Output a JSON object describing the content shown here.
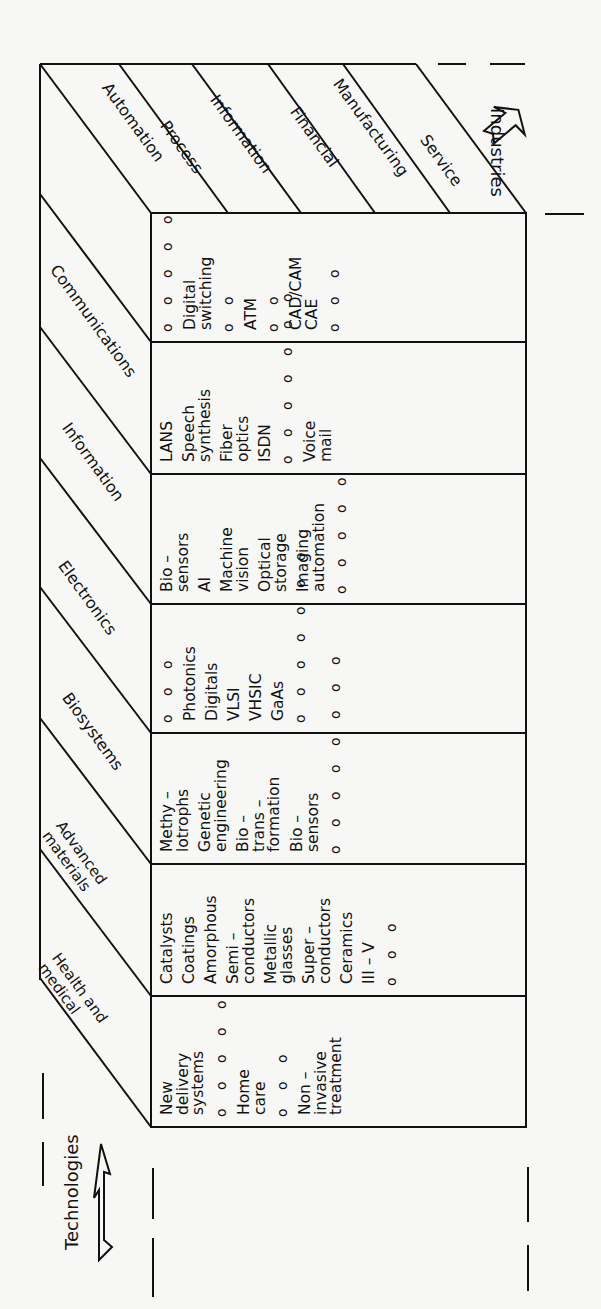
{
  "diagram": {
    "orientation": "rotated 90 degrees counterclockwise",
    "axis_labels": {
      "industries": "Industries",
      "technologies": "Technologies"
    },
    "industries": [
      "Automation",
      "Process",
      "Information",
      "Financial",
      "Manufacturing",
      "Service"
    ],
    "technologies": [
      "Communications",
      "Information",
      "Electronics",
      "Biosystems",
      "Advanced materials",
      "Health and medical"
    ],
    "technology_labels_multiline": {
      "advanced_materials": [
        "Advanced",
        "materials"
      ],
      "health_and_medical": [
        "Health and",
        "medical"
      ]
    },
    "rows": [
      {
        "technology": "Communications",
        "items": [
          "Digital switching",
          "ATM",
          "CAD/CAM CAE"
        ],
        "text_lines": [
          {
            "t": "o o o o o",
            "kind": "dots"
          },
          {
            "t": "Digital\nswitching"
          },
          {
            "t": "o o",
            "kind": "dots"
          },
          {
            "t": "ATM"
          },
          {
            "t": "o o",
            "kind": "dots"
          },
          {
            "t": "CAD/CAM\nCAE"
          },
          {
            "t": "o o o",
            "kind": "dots"
          }
        ]
      },
      {
        "technology": "Information",
        "items": [
          "LANS",
          "Speech synthesis",
          "Fiber optics",
          "ISDN",
          "Voice mail"
        ],
        "text_lines": [
          {
            "t": "LANS"
          },
          {
            "t": "Speech\nsynthesis"
          },
          {
            "t": "Fiber\noptics"
          },
          {
            "t": "ISDN"
          },
          {
            "t": "o o o o o o o",
            "kind": "dots"
          },
          {
            "t": "Voice\nmail"
          }
        ]
      },
      {
        "technology": "Electronics",
        "items": [
          "Bio-sensors",
          "AI",
          "Machine vision",
          "Optical storage",
          "Imaging automation"
        ],
        "text_lines": [
          {
            "t": "Bio –\nsensors"
          },
          {
            "t": "AI"
          },
          {
            "t": "Machine\nvision"
          },
          {
            "t": "Optical\nstorage"
          },
          {
            "t": "Imaging\nautomation"
          },
          {
            "t": "o o o o o",
            "kind": "dots"
          }
        ]
      },
      {
        "technology": "Biosystems",
        "items": [
          "Photonics",
          "Digitals",
          "VLSI",
          "VHSIC",
          "GaAs"
        ],
        "text_lines": [
          {
            "t": "o o o",
            "kind": "dots"
          },
          {
            "t": "Photonics"
          },
          {
            "t": "Digitals"
          },
          {
            "t": "VLSI"
          },
          {
            "t": "VHSIC"
          },
          {
            "t": "GaAs"
          },
          {
            "t": "o o o o o o o",
            "kind": "dots"
          }
        ]
      },
      {
        "technology": "Advanced materials",
        "items": [
          "Methylotrophs",
          "Genetic engineering",
          "Bio-transformation",
          "Bio-sensors"
        ],
        "text_lines": [
          {
            "t": "Methy –\nlotrophs"
          },
          {
            "t": "Genetic\nengineering"
          },
          {
            "t": "Bio –\ntrans –\nformation"
          },
          {
            "t": "Bio –\nsensors"
          },
          {
            "t": "o o o o o o o o",
            "kind": "dots"
          }
        ]
      },
      {
        "technology": "Health and medical",
        "items": [
          "Catalysts",
          "Coatings",
          "Amorphous",
          "Semi-conductors",
          "Metallic glasses",
          "Super-conductors",
          "Ceramics",
          "III-V"
        ],
        "text_lines": [
          {
            "t": "Catalysts"
          },
          {
            "t": "Coatings"
          },
          {
            "t": "Amorphous"
          },
          {
            "t": "Semi –\nconductors"
          },
          {
            "t": "Metallic\nglasses"
          },
          {
            "t": "Super –\nconductors"
          },
          {
            "t": "Ceramics"
          },
          {
            "t": "III – V"
          },
          {
            "t": "o o o",
            "kind": "dots"
          }
        ]
      },
      {
        "technology": "(bottom)",
        "items": [
          "New delivery systems",
          "Home care",
          "Non-invasive treatment"
        ],
        "text_lines": [
          {
            "t": "New\ndelivery\nsystems"
          },
          {
            "t": "o o o o o",
            "kind": "dots"
          },
          {
            "t": "Home\ncare"
          },
          {
            "t": "o o o",
            "kind": "dots"
          },
          {
            "t": "Non –\ninvasive\ntreatment"
          }
        ]
      }
    ],
    "colors": {
      "line": "#111111",
      "background": "#f7f7f5",
      "text": "#111111"
    }
  }
}
